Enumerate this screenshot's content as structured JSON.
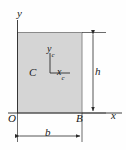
{
  "figure": {
    "background_color": "#fefefe"
  },
  "shape": {
    "name": "rectangle",
    "fill_color": "#d5d5d5",
    "stroke_color": "#7a7a7a",
    "x": 17,
    "y": 32,
    "width": 65,
    "height": 81
  },
  "axes": {
    "global": {
      "origin_label": "O",
      "x_label": "x",
      "y_label": "y",
      "color": "#2b2b2b"
    },
    "centroidal": {
      "centroid_label": "C",
      "x_label": "x",
      "x_subscript": "c",
      "y_label": "y",
      "y_subscript": "c",
      "color": "#2b2b2b"
    }
  },
  "points": {
    "corner_label": "B"
  },
  "dimensions": {
    "width": {
      "label": "b",
      "orientation": "horizontal"
    },
    "height": {
      "label": "h",
      "orientation": "vertical"
    }
  }
}
